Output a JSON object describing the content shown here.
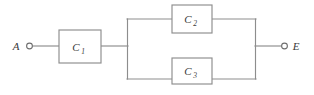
{
  "diagram": {
    "type": "electrical-circuit-block-diagram",
    "title": "",
    "background_color": "#ffffff",
    "line_color": "#8d8d8d",
    "text_color": "#3a3a3a",
    "terminals": [
      {
        "id": "A",
        "label": "A",
        "position": "left",
        "x": 28,
        "y": 46,
        "label_x": 16,
        "label_y": 50
      },
      {
        "id": "E",
        "label": "E",
        "position": "right",
        "x": 285,
        "y": 46,
        "label_x": 293,
        "label_y": 50
      }
    ],
    "components": [
      {
        "id": "C1",
        "label": "C",
        "subscript": "1",
        "x": 59,
        "y": 30,
        "width": 42,
        "height": 33,
        "branch": "series"
      },
      {
        "id": "C2",
        "label": "C",
        "subscript": "2",
        "x": 172,
        "y": 5,
        "width": 40,
        "height": 28,
        "branch": "parallel-top"
      },
      {
        "id": "C3",
        "label": "C",
        "subscript": "3",
        "x": 172,
        "y": 58,
        "width": 40,
        "height": 26,
        "branch": "parallel-bottom"
      }
    ],
    "buses": [
      {
        "id": "left-parallel-bus",
        "x": 127,
        "y1": 19,
        "y2": 79
      },
      {
        "id": "right-parallel-bus",
        "x": 255,
        "y1": 19,
        "y2": 79
      }
    ],
    "wires": [
      {
        "id": "wire-a-to-c1",
        "x1": 33,
        "y1": 46,
        "x2": 59,
        "y2": 46
      },
      {
        "id": "wire-c1-to-left-bus",
        "x1": 101,
        "y1": 46,
        "x2": 127,
        "y2": 46
      },
      {
        "id": "wire-left-bus-to-c2",
        "x1": 127,
        "y1": 19,
        "x2": 172,
        "y2": 19
      },
      {
        "id": "wire-c2-to-right-bus",
        "x1": 212,
        "y1": 19,
        "x2": 255,
        "y2": 19
      },
      {
        "id": "wire-left-bus-to-c3",
        "x1": 127,
        "y1": 79,
        "x2": 172,
        "y2": 79
      },
      {
        "id": "wire-c3-to-right-bus",
        "x1": 212,
        "y1": 79,
        "x2": 255,
        "y2": 79
      },
      {
        "id": "wire-right-bus-to-e",
        "x1": 255,
        "y1": 46,
        "x2": 281,
        "y2": 46
      }
    ]
  }
}
